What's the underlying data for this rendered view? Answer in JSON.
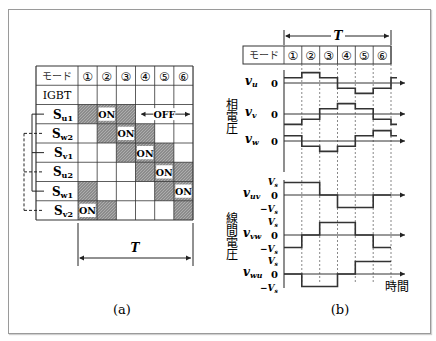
{
  "figure_a": {
    "caption": "(a)",
    "header_label": "モード",
    "modes": [
      "①",
      "②",
      "③",
      "④",
      "⑤",
      "⑥"
    ],
    "igbt_label": "IGBT",
    "rows": [
      {
        "name": "S",
        "sub": "u1",
        "shaded": [
          1,
          3
        ],
        "on": 2,
        "off_label": "OFF",
        "group": "solid"
      },
      {
        "name": "S",
        "sub": "w2",
        "shaded": [
          2,
          4
        ],
        "on": 3,
        "group": "dashed"
      },
      {
        "name": "S",
        "sub": "v1",
        "shaded": [
          3,
          5
        ],
        "on": 4,
        "group": "solid"
      },
      {
        "name": "S",
        "sub": "u2",
        "shaded": [
          4,
          6
        ],
        "on": 5,
        "group": "dashed"
      },
      {
        "name": "S",
        "sub": "w1",
        "shaded": [
          1,
          5
        ],
        "on": 6,
        "group": "solid"
      },
      {
        "name": "S",
        "sub": "v2",
        "shaded": [
          2,
          6
        ],
        "on": 1,
        "group": "dashed"
      }
    ],
    "on_label": "ON",
    "period_label": "T"
  },
  "figure_b": {
    "caption": "(b)",
    "header_label": "モード",
    "modes": [
      "①",
      "②",
      "③",
      "④",
      "⑤",
      "⑥"
    ],
    "period_label": "T",
    "phase_group_label": "相電圧",
    "line_group_label": "線間電圧",
    "time_label": "時間",
    "zero_label": "0",
    "vs_label": "V",
    "vs_sub": "s",
    "neg_vs_label": "−V",
    "phase_signals": [
      {
        "label": "v",
        "sub": "u",
        "levels": [
          1,
          2,
          1,
          -1,
          -2,
          -1
        ]
      },
      {
        "label": "v",
        "sub": "v",
        "levels": [
          -2,
          -1,
          1,
          2,
          1,
          -1
        ]
      },
      {
        "label": "v",
        "sub": "w",
        "levels": [
          1,
          -1,
          -2,
          -1,
          1,
          2
        ]
      }
    ],
    "line_signals": [
      {
        "label": "v",
        "sub": "uv",
        "levels": [
          1,
          1,
          0,
          -1,
          -1,
          0
        ]
      },
      {
        "label": "v",
        "sub": "vw",
        "levels": [
          -1,
          0,
          1,
          1,
          0,
          -1
        ]
      },
      {
        "label": "v",
        "sub": "wu",
        "levels": [
          0,
          -1,
          -1,
          0,
          1,
          1
        ]
      }
    ]
  }
}
